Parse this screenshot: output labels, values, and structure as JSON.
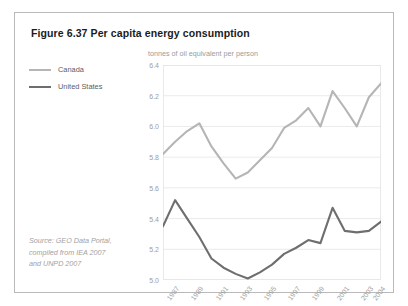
{
  "figure": {
    "title": "Figure 6.37 Per capita energy consumption",
    "source_lines": [
      "Source: GEO Data Portal,",
      "compiled from IEA 2007",
      "and UNPD 2007"
    ]
  },
  "legend": {
    "position": "left",
    "entries": [
      {
        "label": "Canada",
        "color": "#b5b5b5"
      },
      {
        "label": "United States",
        "color": "#6e6e6e"
      }
    ]
  },
  "colors": {
    "frame_border": "#b9b9b9",
    "grid": "#e4e4e4",
    "axis_text": "#9d9d9d",
    "title_text": "#1b1b1b",
    "source_text": "#a2a2a2",
    "canada": "#b5b5b5",
    "united_states": "#6e6e6e"
  },
  "chart_data": {
    "type": "line",
    "title": "Figure 6.37 Per capita energy consumption",
    "xlabel": "",
    "ylabel": "tonnes of oil equivalent per person",
    "ylim": [
      5.0,
      6.4
    ],
    "yticks": [
      "5.0",
      "5.2",
      "5.4",
      "5.6",
      "5.8",
      "6.0",
      "6.2",
      "6.4"
    ],
    "ytick_values": [
      5.0,
      5.2,
      5.4,
      5.6,
      5.8,
      6.0,
      6.2,
      6.4
    ],
    "grid": true,
    "xlim": [
      1986,
      2004
    ],
    "x": [
      1986,
      1987,
      1988,
      1989,
      1990,
      1991,
      1992,
      1993,
      1994,
      1995,
      1996,
      1997,
      1998,
      1999,
      2000,
      2001,
      2002,
      2003,
      2004
    ],
    "xticks": [
      "1987",
      "1989",
      "1991",
      "1993",
      "1995",
      "1997",
      "1999",
      "2001",
      "2003",
      "2004"
    ],
    "xtick_values": [
      1987,
      1989,
      1991,
      1993,
      1995,
      1997,
      1999,
      2001,
      2003,
      2004
    ],
    "series": [
      {
        "name": "Canada",
        "color": "#b5b5b5",
        "values": [
          5.82,
          5.9,
          5.97,
          6.02,
          5.87,
          5.76,
          5.66,
          5.7,
          5.78,
          5.86,
          5.99,
          6.04,
          6.12,
          6.0,
          6.23,
          6.12,
          6.0,
          6.19,
          6.28
        ]
      },
      {
        "name": "United States",
        "color": "#6e6e6e",
        "values": [
          5.35,
          5.52,
          5.4,
          5.28,
          5.14,
          5.08,
          5.04,
          5.01,
          5.05,
          5.1,
          5.17,
          5.21,
          5.26,
          5.24,
          5.47,
          5.32,
          5.31,
          5.32,
          5.38
        ]
      }
    ]
  }
}
